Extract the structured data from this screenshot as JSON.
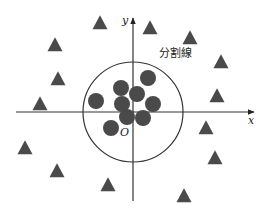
{
  "diagram": {
    "title": "",
    "colors": {
      "marker": "#4a4a4a",
      "axis": "#333333",
      "boundary": "#333333",
      "background": "#ffffff"
    },
    "axes": {
      "origin": [
        133,
        112
      ],
      "x_label": "x",
      "y_label": "y",
      "origin_label": "O"
    },
    "boundary": {
      "label": "分割線",
      "shape": "circle",
      "center": [
        133,
        112
      ],
      "radius": 50
    },
    "circles": [
      {
        "x": 96,
        "y": 101
      },
      {
        "x": 121,
        "y": 88
      },
      {
        "x": 148,
        "y": 78
      },
      {
        "x": 137,
        "y": 94
      },
      {
        "x": 122,
        "y": 104
      },
      {
        "x": 153,
        "y": 104
      },
      {
        "x": 127,
        "y": 117
      },
      {
        "x": 143,
        "y": 118
      },
      {
        "x": 111,
        "y": 128
      }
    ],
    "triangles": [
      {
        "x": 100,
        "y": 23
      },
      {
        "x": 150,
        "y": 28
      },
      {
        "x": 55,
        "y": 45
      },
      {
        "x": 190,
        "y": 38
      },
      {
        "x": 58,
        "y": 79
      },
      {
        "x": 221,
        "y": 62
      },
      {
        "x": 40,
        "y": 104
      },
      {
        "x": 217,
        "y": 96
      },
      {
        "x": 206,
        "y": 128
      },
      {
        "x": 25,
        "y": 148
      },
      {
        "x": 215,
        "y": 158
      },
      {
        "x": 57,
        "y": 171
      },
      {
        "x": 108,
        "y": 185
      },
      {
        "x": 184,
        "y": 196
      }
    ]
  }
}
